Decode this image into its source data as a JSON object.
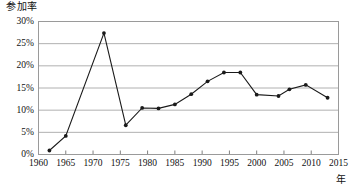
{
  "chart_data": {
    "type": "line",
    "title": "",
    "ylabel": "参加率",
    "xlabel": "年",
    "xlim": [
      1960,
      2015
    ],
    "ylim": [
      0,
      30
    ],
    "grid": "horizontal",
    "legend": "none",
    "y_ticks": [
      "0%",
      "5%",
      "10%",
      "15%",
      "20%",
      "25%",
      "30%"
    ],
    "y_tick_values": [
      0,
      5,
      10,
      15,
      20,
      25,
      30
    ],
    "x_ticks": [
      "1960",
      "1965",
      "1970",
      "1975",
      "1980",
      "1985",
      "1990",
      "1995",
      "2000",
      "2005",
      "2010",
      "2015"
    ],
    "x_tick_values": [
      1960,
      1965,
      1970,
      1975,
      1980,
      1985,
      1990,
      1995,
      2000,
      2005,
      2010,
      2015
    ],
    "x": [
      1962,
      1965,
      1972,
      1976,
      1979,
      1982,
      1985,
      1988,
      1991,
      1994,
      1997,
      2000,
      2004,
      2006,
      2009,
      2013
    ],
    "values": [
      0.9,
      4.2,
      27.4,
      6.6,
      10.5,
      10.4,
      11.3,
      13.6,
      16.5,
      18.5,
      18.5,
      13.5,
      13.2,
      14.7,
      15.7,
      12.8
    ],
    "series": [
      {
        "name": "参加率",
        "x": [
          1962,
          1965,
          1972,
          1976,
          1979,
          1982,
          1985,
          1988,
          1991,
          1994,
          1997,
          2000,
          2004,
          2006,
          2009,
          2013
        ],
        "values": [
          0.9,
          4.2,
          27.4,
          6.6,
          10.5,
          10.4,
          11.3,
          13.6,
          16.5,
          18.5,
          18.5,
          13.5,
          13.2,
          14.7,
          15.7,
          12.8
        ]
      }
    ],
    "colors": {
      "line": "#1a1a1a",
      "marker": "#1a1a1a",
      "grid": "#b0b0b0",
      "axis": "#808080",
      "background": "#ffffff"
    }
  }
}
